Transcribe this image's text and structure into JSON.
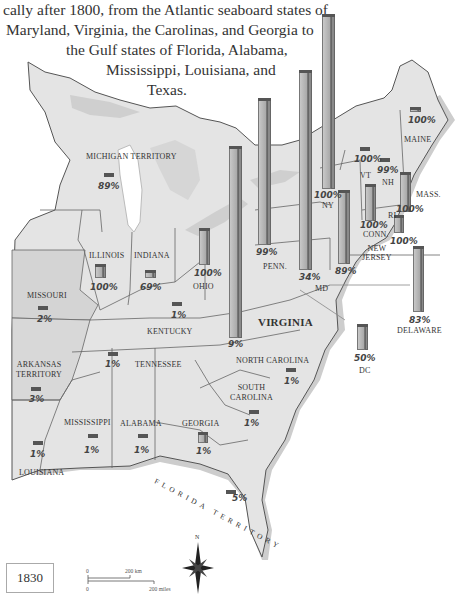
{
  "intro_text": {
    "lines": [
      "cally after 1800, from the Atlantic seaboard states of",
      "Maryland, Virginia, the Carolinas, and Georgia to",
      "the Gulf states of Florida, Alabama,",
      "Mississippi, Louisiana, and",
      "Texas."
    ]
  },
  "map": {
    "year": "1830",
    "scale": {
      "zero_km": "0",
      "km_label": "200 km",
      "zero_mi": "0",
      "mi_label": "200 miles"
    },
    "compass": {
      "north_label": "N"
    },
    "colors": {
      "land": "#e4e4e4",
      "coast": "#c4c4c4",
      "border": "#555555",
      "bar_front": "#b8b8b8",
      "bar_side": "#8a8a8a",
      "bar_top": "#555555",
      "water": "#ffffff"
    },
    "regions": [
      {
        "name": "MAINE",
        "percent": "100%"
      },
      {
        "name": "VT",
        "percent": "100%"
      },
      {
        "name": "NH",
        "percent": "99%"
      },
      {
        "name": "MASS.",
        "percent": "100%"
      },
      {
        "name": "CONN.",
        "percent": "100%"
      },
      {
        "name": "RI",
        "percent": "100%"
      },
      {
        "name": "NY",
        "percent": "100%"
      },
      {
        "name": "NEW JERSEY",
        "percent": "89%"
      },
      {
        "name": "PENN.",
        "percent": "99%"
      },
      {
        "name": "DELAWARE",
        "percent": "83%"
      },
      {
        "name": "MD",
        "percent": "34%"
      },
      {
        "name": "DC",
        "percent": "50%"
      },
      {
        "name": "MICHIGAN TERRITORY",
        "percent": "89%"
      },
      {
        "name": "OHIO",
        "percent": "100%"
      },
      {
        "name": "INDIANA",
        "percent": "69%"
      },
      {
        "name": "ILLINOIS",
        "percent": "100%"
      },
      {
        "name": "VIRGINIA",
        "percent": "9%"
      },
      {
        "name": "KENTUCKY",
        "percent": "1%"
      },
      {
        "name": "MISSOURI",
        "percent": "2%"
      },
      {
        "name": "TENNESSEE",
        "percent": "1%"
      },
      {
        "name": "NORTH CAROLINA",
        "percent": "1%"
      },
      {
        "name": "ARKANSAS TERRITORY",
        "percent": "3%"
      },
      {
        "name": "SOUTH CAROLINA",
        "percent": "1%"
      },
      {
        "name": "MISSISSIPPI",
        "percent": "1%"
      },
      {
        "name": "ALABAMA",
        "percent": "1%"
      },
      {
        "name": "GEORGIA",
        "percent": "1%"
      },
      {
        "name": "LOUISIANA",
        "percent": "1%"
      },
      {
        "name": "FLORIDA TERRITORY",
        "percent": "5%"
      }
    ]
  }
}
